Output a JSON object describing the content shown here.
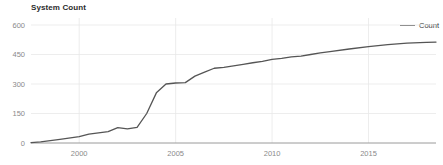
{
  "chart_data": {
    "type": "line",
    "title": "System Count",
    "xlabel": "",
    "ylabel": "",
    "grid": true,
    "legend_position": "top-right",
    "xlim": [
      1997.5,
      2018.5
    ],
    "ylim": [
      0,
      600
    ],
    "yticks": [
      0,
      150,
      300,
      450,
      600
    ],
    "ytick_labels": [
      "0",
      "150",
      "300",
      "450",
      "600"
    ],
    "xticks": [
      2000,
      2005,
      2010,
      2015
    ],
    "xtick_labels": [
      "2000",
      "2005",
      "2010",
      "2015"
    ],
    "series": [
      {
        "name": "Count",
        "color": "#555555",
        "x": [
          1997.5,
          1998,
          1999,
          2000,
          2000.5,
          2001,
          2001.5,
          2002,
          2002.5,
          2003,
          2003.5,
          2004,
          2004.5,
          2005,
          2005.5,
          2006,
          2006.5,
          2007,
          2007.5,
          2008,
          2008.5,
          2009,
          2009.5,
          2010,
          2010.5,
          2011,
          2011.5,
          2012,
          2012.5,
          2013,
          2014,
          2015,
          2016,
          2017,
          2018,
          2018.5
        ],
        "y": [
          2,
          6,
          18,
          32,
          45,
          52,
          58,
          78,
          72,
          80,
          150,
          255,
          300,
          305,
          307,
          340,
          360,
          380,
          385,
          392,
          400,
          408,
          415,
          425,
          430,
          438,
          442,
          450,
          458,
          465,
          478,
          490,
          500,
          508,
          512,
          513
        ]
      }
    ]
  },
  "legend": {
    "entries": [
      {
        "label": "Count",
        "color": "#555555"
      }
    ]
  }
}
